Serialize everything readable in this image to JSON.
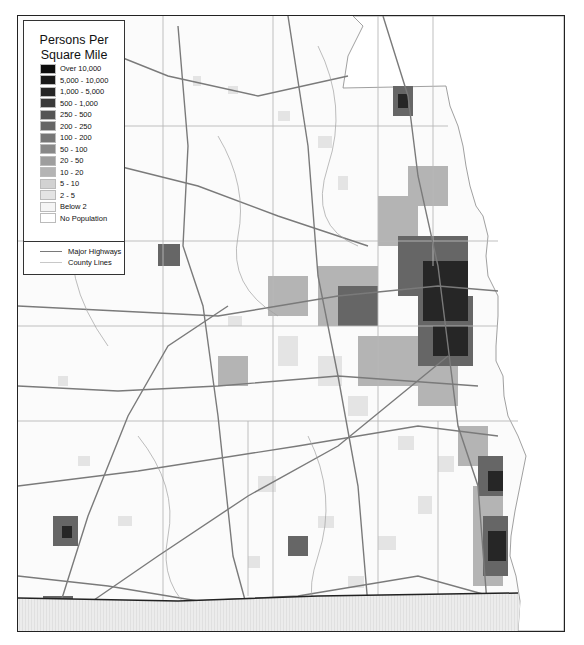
{
  "legend": {
    "title_line1": "Persons Per",
    "title_line2": "Square Mile",
    "classes": [
      {
        "label": "Over 10,000",
        "color": "#0d0d0d"
      },
      {
        "label": "5,000 - 10,000",
        "color": "#191919"
      },
      {
        "label": "1,000 - 5,000",
        "color": "#262626"
      },
      {
        "label": "500 - 1,000",
        "color": "#3a3a3a"
      },
      {
        "label": "250 - 500",
        "color": "#555555"
      },
      {
        "label": "200 - 250",
        "color": "#666666"
      },
      {
        "label": "100 - 200",
        "color": "#777777"
      },
      {
        "label": "50 - 100",
        "color": "#888888"
      },
      {
        "label": "20 - 50",
        "color": "#9e9e9e"
      },
      {
        "label": "10 - 20",
        "color": "#b4b4b4"
      },
      {
        "label": "5 - 10",
        "color": "#d2d2d2"
      },
      {
        "label": "2 - 5",
        "color": "#e4e4e4"
      },
      {
        "label": "Below 2",
        "color": "#f5f5f5"
      },
      {
        "label": "No Population",
        "color": "#ffffff"
      }
    ],
    "lines": [
      {
        "label": "Major Highways",
        "color": "#7a7a7a",
        "width": 1.4
      },
      {
        "label": "County Lines",
        "color": "#c8c8c8",
        "width": 1
      }
    ]
  },
  "map": {
    "lake_color": "#ffffff",
    "state_below_color": "#ececec",
    "frame_color": "#222222"
  }
}
